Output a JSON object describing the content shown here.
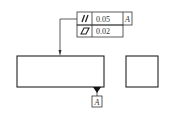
{
  "feature_control_frame": {
    "rows": [
      {
        "symbol": "parallelism",
        "symbol_glyph": "//",
        "tolerance": "0.05",
        "datum": "A"
      },
      {
        "symbol": "flatness",
        "symbol_glyph": "▱",
        "tolerance": "0.02",
        "datum": ""
      }
    ]
  },
  "datum_feature": {
    "label": "A"
  },
  "colors": {
    "line": "#222222",
    "background": "#ffffff"
  }
}
